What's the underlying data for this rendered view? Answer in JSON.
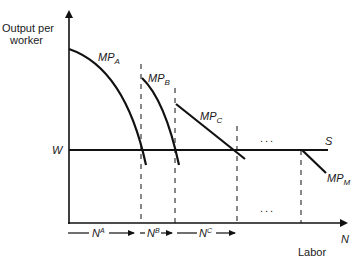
{
  "diagram": {
    "y_axis_label_line1": "Output per",
    "y_axis_label_line2": "worker",
    "x_axis_label": "Labor",
    "x_axis_symbol": "N",
    "wage_label": "W",
    "supply_label": "S",
    "curves": [
      {
        "id": "A",
        "base": "MP",
        "sub": "A"
      },
      {
        "id": "B",
        "base": "MP",
        "sub": "B"
      },
      {
        "id": "C",
        "base": "MP",
        "sub": "C"
      },
      {
        "id": "M",
        "base": "MP",
        "sub": "M"
      }
    ],
    "segments": [
      {
        "base": "N",
        "sup": "A"
      },
      {
        "base": "N",
        "sup": "B"
      },
      {
        "base": "N",
        "sup": "C"
      }
    ],
    "ellipsis_top": "...",
    "ellipsis_bottom": "...",
    "colors": {
      "line": "#111111",
      "background": "#ffffff"
    }
  }
}
